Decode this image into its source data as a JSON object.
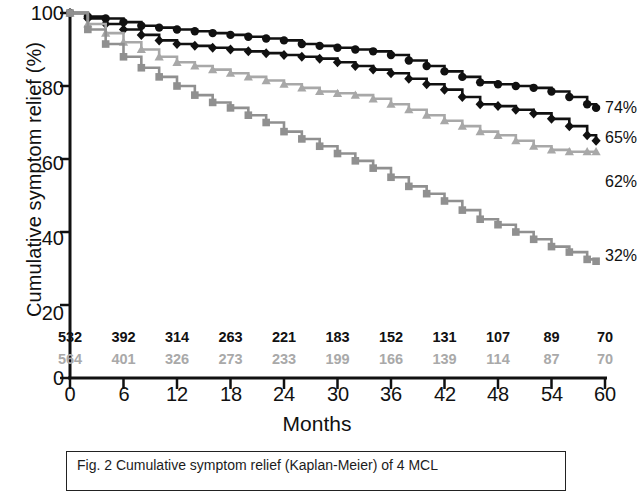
{
  "chart_data": {
    "type": "line",
    "subtype": "kaplan-meier-step",
    "title": "",
    "xlabel": "Months",
    "ylabel": "Cumulative symptom relief (%)",
    "xlim": [
      0,
      60
    ],
    "ylim": [
      0,
      100
    ],
    "xticks": [
      0,
      6,
      12,
      18,
      24,
      30,
      36,
      42,
      48,
      54,
      60
    ],
    "yticks": [
      0,
      20,
      40,
      60,
      80,
      100
    ],
    "grid": false,
    "legend_position": "right-end-labels",
    "series": [
      {
        "name": "series-circle",
        "marker": "circle",
        "color": "#111111",
        "end_label": "74%",
        "end_value": 74,
        "x": [
          0,
          2,
          4,
          6,
          8,
          10,
          12,
          14,
          16,
          18,
          20,
          22,
          24,
          26,
          28,
          30,
          32,
          34,
          36,
          38,
          40,
          42,
          44,
          46,
          48,
          50,
          52,
          54,
          56,
          58,
          59
        ],
        "values": [
          100,
          99,
          98.5,
          97.5,
          96.5,
          96,
          95.5,
          95,
          94.5,
          94,
          93.5,
          93,
          92.5,
          91.5,
          91,
          90.5,
          90,
          89.5,
          88.5,
          87,
          85.5,
          84,
          82.5,
          81,
          80.5,
          80,
          79.5,
          78.5,
          77,
          75,
          74
        ]
      },
      {
        "name": "series-diamond",
        "marker": "diamond",
        "color": "#111111",
        "end_label": "65%",
        "end_value": 65,
        "x": [
          0,
          2,
          4,
          6,
          8,
          10,
          12,
          14,
          16,
          18,
          20,
          22,
          24,
          26,
          28,
          30,
          32,
          34,
          36,
          38,
          40,
          42,
          44,
          46,
          48,
          50,
          52,
          54,
          56,
          58,
          59
        ],
        "values": [
          100,
          98.5,
          97,
          95.5,
          94,
          92.5,
          91.5,
          91,
          90.5,
          90,
          89.5,
          89,
          88.5,
          88,
          87.5,
          86.5,
          85.5,
          84.5,
          83.5,
          82,
          80.5,
          79,
          77,
          75,
          74.5,
          73.5,
          72.5,
          71,
          69,
          66.5,
          65
        ]
      },
      {
        "name": "series-triangle",
        "marker": "triangle",
        "color": "#a8a8a8",
        "end_label": "62%",
        "end_value": 62,
        "x": [
          0,
          2,
          4,
          6,
          8,
          10,
          12,
          14,
          16,
          18,
          20,
          22,
          24,
          26,
          28,
          30,
          32,
          34,
          36,
          38,
          40,
          42,
          44,
          46,
          48,
          50,
          52,
          54,
          56,
          58,
          59
        ],
        "values": [
          100,
          97,
          94.5,
          92,
          90,
          88,
          86.5,
          85.5,
          84.5,
          83.5,
          82.5,
          81.5,
          80.5,
          79.5,
          78.5,
          78,
          77.5,
          76.5,
          75,
          73.5,
          72,
          70.5,
          69,
          67.5,
          66.5,
          65,
          63.5,
          62.5,
          62,
          62,
          62
        ]
      },
      {
        "name": "series-square",
        "marker": "square",
        "color": "#909090",
        "end_label": "32%",
        "end_value": 32,
        "x": [
          0,
          2,
          4,
          6,
          8,
          10,
          12,
          14,
          16,
          18,
          20,
          22,
          24,
          26,
          28,
          30,
          32,
          34,
          36,
          38,
          40,
          42,
          44,
          46,
          48,
          50,
          52,
          54,
          56,
          58,
          59
        ],
        "values": [
          100,
          95.5,
          91.5,
          88,
          85,
          82.5,
          80,
          77.5,
          75.5,
          74,
          72,
          70,
          67.5,
          65.5,
          63.5,
          61.5,
          59.5,
          57.5,
          55,
          52.5,
          50.5,
          48.5,
          46,
          43.5,
          42,
          40,
          38,
          36,
          34.5,
          32.5,
          32
        ]
      }
    ],
    "numbers_at_risk": {
      "x": [
        0,
        6,
        12,
        18,
        24,
        30,
        36,
        42,
        48,
        54,
        60
      ],
      "rows": [
        {
          "name": "at-risk-black",
          "color": "#111111",
          "values": [
            "532",
            "392",
            "314",
            "263",
            "221",
            "183",
            "152",
            "131",
            "107",
            "89",
            "70"
          ]
        },
        {
          "name": "at-risk-gray",
          "color": "#a9a9a9",
          "values": [
            "564",
            "401",
            "326",
            "273",
            "233",
            "199",
            "166",
            "139",
            "114",
            "87",
            "70"
          ]
        }
      ]
    }
  },
  "axes": {
    "y_title": "Cumulative symptom relief (%)",
    "y_tick_labels": [
      "100",
      "80",
      "60",
      "40",
      "20",
      "0"
    ],
    "x_tick_labels": [
      "0",
      "6",
      "12",
      "18",
      "24",
      "30",
      "36",
      "42",
      "48",
      "54",
      "60"
    ],
    "x_title": "Months"
  },
  "end_labels": [
    {
      "name": "end-label-74",
      "text": "74%"
    },
    {
      "name": "end-label-65",
      "text": "65%"
    },
    {
      "name": "end-label-62",
      "text": "62%"
    },
    {
      "name": "end-label-32",
      "text": "32%"
    }
  ],
  "legend": {
    "caption": "Fig. 2 Cumulative symptom relief (Kaplan-Meier) of 4 MCL"
  }
}
